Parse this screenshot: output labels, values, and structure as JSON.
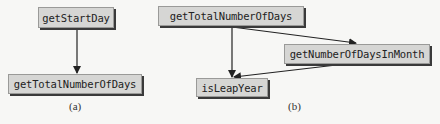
{
  "diagram": {
    "panels": [
      {
        "caption": "(a)",
        "nodes": [
          {
            "id": "a_getStartDay",
            "label": "getStartDay"
          },
          {
            "id": "a_getTotalNumberOfDays",
            "label": "getTotalNumberOfDays"
          }
        ],
        "edges": [
          {
            "from": "a_getStartDay",
            "to": "a_getTotalNumberOfDays"
          }
        ]
      },
      {
        "caption": "(b)",
        "nodes": [
          {
            "id": "b_getTotalNumberOfDays",
            "label": "getTotalNumberOfDays"
          },
          {
            "id": "b_getNumberOfDaysInMonth",
            "label": "getNumberOfDaysInMonth"
          },
          {
            "id": "b_isLeapYear",
            "label": "isLeapYear"
          }
        ],
        "edges": [
          {
            "from": "b_getTotalNumberOfDays",
            "to": "b_isLeapYear"
          },
          {
            "from": "b_getTotalNumberOfDays",
            "to": "b_getNumberOfDaysInMonth"
          },
          {
            "from": "b_getNumberOfDaysInMonth",
            "to": "b_isLeapYear"
          }
        ]
      }
    ]
  }
}
